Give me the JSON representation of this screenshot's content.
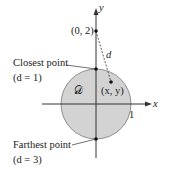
{
  "diagram": {
    "region_label": "𝒟",
    "point_label": "(x, y)",
    "fixed_point_label": "(0, 2)",
    "distance_label": "d",
    "x_axis_label": "x",
    "y_axis_label": "y",
    "radius_tick_label": "1",
    "closest": {
      "title": "Closest point",
      "value": "(d = 1)"
    },
    "farthest": {
      "title": "Farthest point",
      "value": "(d = 3)"
    },
    "colors": {
      "region_fill": "#d3d3d3",
      "stroke": "#333333"
    }
  }
}
